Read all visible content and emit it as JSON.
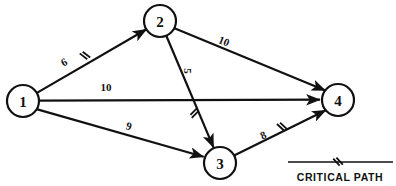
{
  "diagram": {
    "type": "activity-on-arrow-network",
    "title": "",
    "canvas": {
      "width": 396,
      "height": 186,
      "background": "#ffffff"
    },
    "ink_color": "#111111",
    "nodes": [
      {
        "id": "1",
        "label": "1",
        "cx": 23,
        "cy": 101,
        "r": 16
      },
      {
        "id": "2",
        "label": "2",
        "cx": 160,
        "cy": 21,
        "r": 16
      },
      {
        "id": "3",
        "label": "3",
        "cx": 220,
        "cy": 163,
        "r": 16
      },
      {
        "id": "4",
        "label": "4",
        "cx": 338,
        "cy": 100,
        "r": 16
      }
    ],
    "edges": [
      {
        "id": "e1-2",
        "from": "1",
        "to": "2",
        "weight": "6",
        "critical": true,
        "label_x": 64,
        "label_y": 62,
        "label_rotate": -30,
        "mark_x": 84,
        "mark_y": 56,
        "mark_rotate": -30
      },
      {
        "id": "e1-4",
        "from": "1",
        "to": "4",
        "weight": "10",
        "critical": false,
        "label_x": 106,
        "label_y": 87,
        "label_rotate": 0,
        "mark_x": 0,
        "mark_y": 0,
        "mark_rotate": 0
      },
      {
        "id": "e1-3",
        "from": "1",
        "to": "3",
        "weight": "9",
        "critical": false,
        "label_x": 129,
        "label_y": 126,
        "label_rotate": 25,
        "mark_x": 0,
        "mark_y": 0,
        "mark_rotate": 0
      },
      {
        "id": "e2-4",
        "from": "2",
        "to": "4",
        "weight": "10",
        "critical": false,
        "label_x": 224,
        "label_y": 40,
        "label_rotate": 25,
        "mark_x": 0,
        "mark_y": 0,
        "mark_rotate": 0
      },
      {
        "id": "e2-3",
        "from": "2",
        "to": "3",
        "weight": "5",
        "critical": true,
        "label_x": 188,
        "label_y": 71,
        "label_rotate": 90,
        "mark_x": 194,
        "mark_y": 112,
        "mark_rotate": 68
      },
      {
        "id": "e3-4",
        "from": "3",
        "to": "4",
        "weight": "8",
        "critical": true,
        "label_x": 263,
        "label_y": 134,
        "label_rotate": -27,
        "mark_x": 281,
        "mark_y": 127,
        "mark_rotate": -27
      }
    ],
    "legend": {
      "label": "CRITICAL PATH",
      "rule_x1": 288,
      "rule_x2": 393,
      "rule_y": 162,
      "mark_x": 337,
      "mark_y": 162,
      "text_x": 340,
      "text_y": 177
    }
  }
}
